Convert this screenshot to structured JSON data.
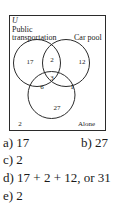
{
  "diagram": {
    "universe_label": "U",
    "sets": [
      {
        "name": "Public transportation",
        "label_lines": [
          "Public",
          "transportation"
        ]
      },
      {
        "name": "Car pool",
        "label_lines": [
          "Car pool"
        ]
      },
      {
        "name": "Alone",
        "label_lines": [
          "Alone"
        ]
      }
    ],
    "regions": {
      "public_only": "17",
      "public_carpool_only": "2",
      "carpool_only": "12",
      "all_three": "3",
      "public_alone_only": "6",
      "carpool_alone_only": "1",
      "alone_only": "27",
      "outside": "2"
    },
    "line_color": "#2b2b2b"
  },
  "answers": [
    {
      "id": "a",
      "text": "a) 17"
    },
    {
      "id": "b",
      "text": "b) 27"
    },
    {
      "id": "c",
      "text": "c) 2"
    },
    {
      "id": "d",
      "text": "d) 17 + 2 + 12, or 31"
    },
    {
      "id": "e",
      "text": "e) 2"
    }
  ]
}
